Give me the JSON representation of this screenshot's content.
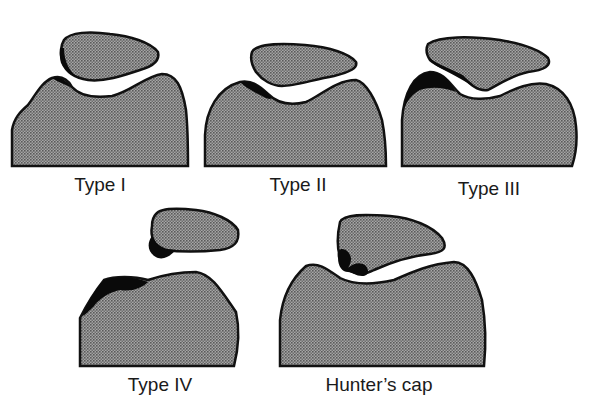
{
  "diagram": {
    "colors": {
      "fill": "#8c8c8c",
      "outline": "#111111",
      "osteophyte": "#0a0a0a",
      "background": "#ffffff"
    },
    "panels": [
      {
        "id": "type1",
        "label": "Type I"
      },
      {
        "id": "type2",
        "label": "Type II"
      },
      {
        "id": "type3",
        "label": "Type III"
      },
      {
        "id": "type4",
        "label": "Type IV"
      },
      {
        "id": "hunters-cap",
        "label": "Hunter’s cap"
      }
    ]
  }
}
